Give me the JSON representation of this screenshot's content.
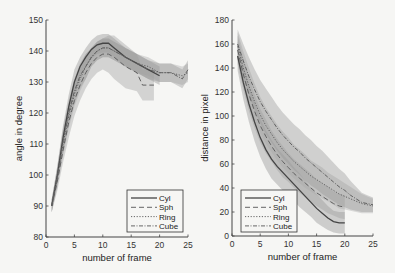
{
  "chart_data": [
    {
      "type": "line",
      "title": "",
      "xlabel": "number of frame",
      "ylabel": "angle in degree",
      "xlim": [
        0,
        25
      ],
      "ylim": [
        80,
        150
      ],
      "xticks": [
        0,
        5,
        10,
        15,
        20,
        25
      ],
      "yticks": [
        80,
        90,
        100,
        110,
        120,
        130,
        140,
        150
      ],
      "grid": false,
      "legend_position": "lower right",
      "shaded_bands": true,
      "series": [
        {
          "name": "Cyl",
          "style": "solid",
          "x": [
            1,
            2,
            3,
            4,
            5,
            6,
            7,
            8,
            9,
            10,
            11,
            12,
            14,
            16,
            18,
            20
          ],
          "y": [
            90,
            100,
            112,
            122,
            130,
            135,
            138,
            140.5,
            142,
            142.5,
            142.5,
            141,
            138,
            136,
            134,
            132
          ],
          "band": [
            2,
            3,
            4,
            4,
            4,
            3,
            3,
            3,
            3,
            3,
            3,
            3,
            3,
            3,
            3,
            3
          ]
        },
        {
          "name": "Sph",
          "style": "dashed",
          "x": [
            1,
            2,
            3,
            4,
            5,
            6,
            7,
            8,
            9,
            10,
            11,
            12,
            14,
            16,
            17,
            18,
            19
          ],
          "y": [
            90,
            98,
            108,
            117,
            124,
            129,
            133,
            136,
            138,
            139,
            139,
            138,
            135,
            133,
            129,
            129,
            129
          ],
          "band": [
            2,
            3,
            4,
            5,
            5,
            5,
            5,
            5,
            5,
            5,
            6,
            7,
            7,
            6,
            5,
            5,
            5
          ]
        },
        {
          "name": "Ring",
          "style": "dotted",
          "x": [
            1,
            2,
            3,
            4,
            5,
            6,
            7,
            8,
            9,
            10,
            11,
            12,
            14,
            16,
            18,
            20,
            22,
            24,
            25
          ],
          "y": [
            90,
            99,
            110,
            119,
            126,
            131,
            135,
            138,
            140,
            141,
            141,
            140,
            138,
            136,
            135,
            133,
            133,
            132,
            133
          ],
          "band": [
            2,
            3,
            4,
            4,
            4,
            4,
            4,
            3,
            3,
            3,
            3,
            3,
            3,
            3,
            3,
            3,
            3,
            3,
            3
          ]
        },
        {
          "name": "Cube",
          "style": "dash-dot",
          "x": [
            1,
            2,
            3,
            4,
            5,
            6,
            7,
            8,
            9,
            10,
            11,
            12,
            14,
            16,
            18,
            20,
            22,
            24,
            25
          ],
          "y": [
            90,
            100,
            111,
            120,
            127,
            132,
            135,
            138,
            140,
            141,
            141,
            140,
            138,
            136,
            134,
            133,
            133,
            131,
            134
          ],
          "band": [
            2,
            3,
            4,
            4,
            4,
            4,
            4,
            3,
            3,
            3,
            3,
            3,
            3,
            3,
            3,
            3,
            3,
            3,
            3
          ]
        }
      ]
    },
    {
      "type": "line",
      "title": "",
      "xlabel": "number of frame",
      "ylabel": "distance in pixel",
      "xlim": [
        0,
        25
      ],
      "ylim": [
        0,
        180
      ],
      "xticks": [
        0,
        5,
        10,
        15,
        20,
        25
      ],
      "yticks": [
        0,
        20,
        40,
        60,
        80,
        100,
        120,
        140,
        160,
        180
      ],
      "grid": false,
      "legend_position": "lower left",
      "shaded_bands": true,
      "series": [
        {
          "name": "Cyl",
          "style": "solid",
          "x": [
            1,
            2,
            3,
            4,
            5,
            6,
            7,
            8,
            9,
            10,
            11,
            12,
            13,
            14,
            15,
            16,
            17,
            18,
            19,
            20
          ],
          "y": [
            150,
            128,
            110,
            95,
            82,
            72,
            64,
            58,
            53,
            48,
            43,
            38,
            33,
            28,
            23,
            19,
            15,
            12,
            11,
            11
          ],
          "band": [
            12,
            14,
            15,
            16,
            16,
            16,
            16,
            15,
            15,
            15,
            14,
            14,
            13,
            12,
            12,
            11,
            10,
            9,
            9,
            9
          ]
        },
        {
          "name": "Sph",
          "style": "dashed",
          "x": [
            1,
            2,
            3,
            4,
            5,
            6,
            7,
            8,
            9,
            10,
            11,
            12,
            13,
            14,
            15,
            16,
            17,
            18,
            19,
            20
          ],
          "y": [
            155,
            135,
            118,
            104,
            92,
            83,
            75,
            68,
            62,
            57,
            52,
            48,
            44,
            40,
            36,
            33,
            30,
            27,
            25,
            24
          ],
          "band": [
            12,
            13,
            14,
            14,
            14,
            14,
            13,
            13,
            13,
            12,
            12,
            12,
            12,
            12,
            11,
            11,
            11,
            10,
            10,
            10
          ]
        },
        {
          "name": "Ring",
          "style": "dotted",
          "x": [
            1,
            2,
            3,
            4,
            5,
            6,
            7,
            8,
            9,
            10,
            11,
            12,
            13,
            14,
            15,
            16,
            17,
            18,
            19,
            20,
            21,
            22,
            23,
            24,
            25
          ],
          "y": [
            158,
            140,
            125,
            112,
            101,
            92,
            85,
            78,
            72,
            67,
            62,
            58,
            54,
            50,
            47,
            44,
            41,
            38,
            35,
            33,
            31,
            29,
            27,
            26,
            25
          ],
          "band": [
            12,
            14,
            15,
            15,
            15,
            15,
            15,
            15,
            15,
            15,
            14,
            14,
            14,
            13,
            13,
            13,
            12,
            12,
            12,
            11,
            10,
            9,
            8,
            7,
            6
          ]
        },
        {
          "name": "Cube",
          "style": "dash-dot",
          "x": [
            1,
            2,
            3,
            4,
            5,
            6,
            7,
            8,
            9,
            10,
            11,
            12,
            13,
            14,
            15,
            16,
            17,
            18,
            19,
            20,
            21,
            22,
            23,
            24,
            25
          ],
          "y": [
            160,
            146,
            133,
            122,
            112,
            104,
            97,
            90,
            84,
            79,
            74,
            70,
            65,
            61,
            57,
            53,
            49,
            45,
            41,
            38,
            34,
            31,
            28,
            27,
            26
          ],
          "band": [
            12,
            14,
            16,
            17,
            18,
            19,
            19,
            19,
            19,
            19,
            19,
            19,
            19,
            19,
            18,
            18,
            17,
            16,
            15,
            14,
            12,
            10,
            8,
            7,
            6
          ]
        }
      ]
    }
  ],
  "legend": [
    "Cyl",
    "Sph",
    "Ring",
    "Cube"
  ],
  "colors": {
    "line": "#555555",
    "band1": "#8a8a8a",
    "band2": "#a5a5a5",
    "axis": "#444444",
    "background": "#f6f6f4"
  }
}
